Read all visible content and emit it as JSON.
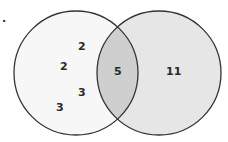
{
  "diagram": {
    "type": "venn",
    "marker": ".",
    "colors": {
      "left_fill": "#f7f7f7",
      "right_fill": "#e6e6e6",
      "intersection_fill": "#cfcfcf",
      "stroke": "#333333",
      "text": "#2a2a2a"
    },
    "left_set": {
      "values": [
        "2",
        "2",
        "3",
        "3"
      ]
    },
    "intersection": {
      "value": "5"
    },
    "right_set": {
      "value": "11"
    }
  }
}
